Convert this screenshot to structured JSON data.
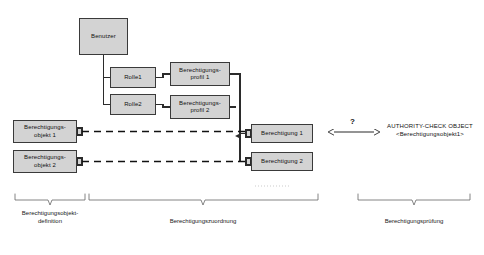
{
  "diagram": {
    "title_present": false,
    "colors": {
      "box_fill": "#d3d3d3",
      "box_border": "#3a3a3a",
      "line": "#2b2b2b",
      "bracket": "#555555",
      "text": "#111111",
      "background": "#ffffff"
    },
    "boxes": [
      {
        "id": "benutzer",
        "label": "Benutzer",
        "x": 79,
        "y": 18,
        "w": 49,
        "h": 37
      },
      {
        "id": "rolle1",
        "label": "Rolle1",
        "x": 110,
        "y": 67,
        "w": 46,
        "h": 21
      },
      {
        "id": "rolle2",
        "label": "Rolle2",
        "x": 110,
        "y": 94,
        "w": 46,
        "h": 21
      },
      {
        "id": "profil1",
        "label": "Berechtigungs-\nprofil 1",
        "x": 170,
        "y": 62,
        "w": 60,
        "h": 24
      },
      {
        "id": "profil2",
        "label": "Berechtigungs-\nprofil 2",
        "x": 170,
        "y": 95,
        "w": 60,
        "h": 24
      },
      {
        "id": "objekt1",
        "label": "Berechtigungs-\nobjekt 1",
        "x": 13,
        "y": 120,
        "w": 64,
        "h": 23
      },
      {
        "id": "objekt2",
        "label": "Berechtigungs-\nobjekt 2",
        "x": 13,
        "y": 150,
        "w": 64,
        "h": 23
      },
      {
        "id": "berecht1",
        "label": "Berechtigung 1",
        "x": 251,
        "y": 124,
        "w": 62,
        "h": 19
      },
      {
        "id": "berecht2",
        "label": "Berechtigung 2",
        "x": 251,
        "y": 152,
        "w": 62,
        "h": 19
      }
    ],
    "annotation": {
      "question_mark": "?",
      "authority_check": "AUTHORITY-CHECK OBJECT\n<Berechtigungsobjekt1>"
    },
    "brackets": [
      {
        "id": "bracket-definition",
        "label": "Berechtigungsobjekt-\ndefinition",
        "x1": 15,
        "x2": 85,
        "y": 200,
        "label_x": 50,
        "label_y": 222
      },
      {
        "id": "bracket-zuordnung",
        "label": "Berechtigungszuordnung",
        "x1": 89,
        "x2": 318,
        "y": 200,
        "label_x": 203,
        "label_y": 228
      },
      {
        "id": "bracket-pruefung",
        "label": "Berechtigungsprüfung",
        "x1": 358,
        "x2": 470,
        "y": 200,
        "label_x": 414,
        "label_y": 228
      }
    ],
    "ellipsis": {
      "id": "ellipsis-dots",
      "x": 255,
      "y": 185,
      "w": 36
    }
  }
}
